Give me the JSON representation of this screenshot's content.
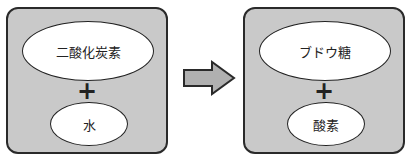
{
  "diagram": {
    "reactants": {
      "top_label": "二酸化炭素",
      "operator": "+",
      "bottom_label": "水"
    },
    "arrow": "right-arrow",
    "products": {
      "top_label": "ブドウ糖",
      "operator": "+",
      "bottom_label": "酸素"
    }
  },
  "colors": {
    "panel_fill": "#c9c9c9",
    "arrow_fill": "#b0b0b0",
    "border": "#2a2a2a"
  }
}
